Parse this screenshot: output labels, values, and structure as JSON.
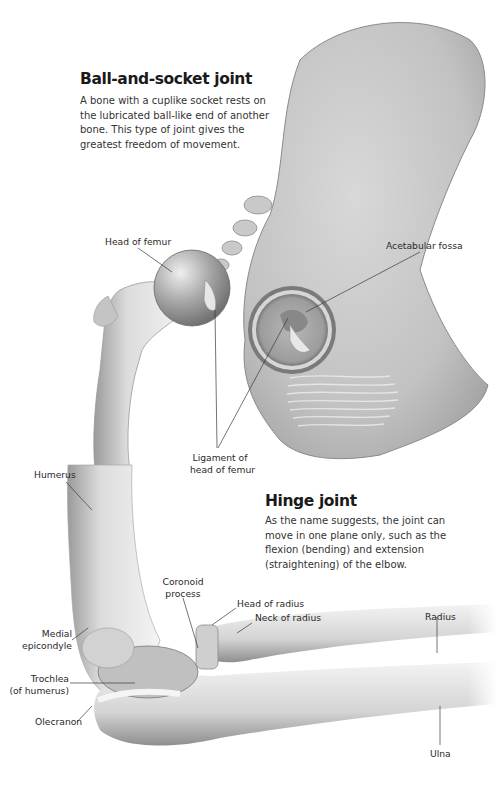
{
  "ball_socket": {
    "title": "Ball-and-socket joint",
    "description": "A bone with a cuplike socket rests on the lubricated ball-like end of another bone. This type of joint gives the greatest freedom of movement.",
    "labels": {
      "head_of_femur": "Head of femur",
      "acetabular_fossa": "Acetabular fossa",
      "ligament_line1": "Ligament of",
      "ligament_line2": "head of femur"
    }
  },
  "hinge": {
    "title": "Hinge joint",
    "description": "As the name suggests, the joint can move in one plane only, such as the flexion (bending) and extension (straightening) of the elbow.",
    "labels": {
      "humerus": "Humerus",
      "coronoid_line1": "Coronoid",
      "coronoid_line2": "process",
      "head_of_radius": "Head of radius",
      "neck_of_radius": "Neck of radius",
      "radius": "Radius",
      "medial_line1": "Medial",
      "medial_line2": "epicondyle",
      "trochlea_line1": "Trochlea",
      "trochlea_line2": "(of humerus)",
      "olecranon": "Olecranon",
      "ulna": "Ulna"
    }
  },
  "colors": {
    "bone_light": "#f2f2f2",
    "bone_mid": "#c8c8c8",
    "bone_dark": "#8a8a8a",
    "leader_line": "#3a3a3a"
  }
}
